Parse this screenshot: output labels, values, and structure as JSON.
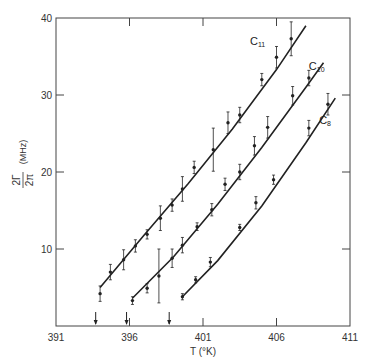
{
  "chart_data": {
    "type": "scatter",
    "title": "",
    "xlabel": "T (°K)",
    "ylabel": "2Γ / 2π (MHz)",
    "ylabel_parts": {
      "numerator": "2Γ",
      "denominator": "2π",
      "unit": "(MHz)"
    },
    "xlim": [
      391,
      411
    ],
    "ylim": [
      0,
      40
    ],
    "xticks": [
      391,
      396,
      401,
      406,
      411
    ],
    "yticks": [
      10,
      20,
      30,
      40
    ],
    "xtick_labels": [
      "391",
      "396",
      "401",
      "406",
      "411"
    ],
    "ytick_labels": [
      "10",
      "20",
      "30",
      "40"
    ],
    "grid": false,
    "legend": "none (curves labeled inline)",
    "arrows_at_T": [
      393.7,
      395.8,
      398.7
    ],
    "series": [
      {
        "name": "C11",
        "label_main": "C",
        "label_sub": "11",
        "label_pos": {
          "T": 404.2,
          "v": 36.5
        },
        "fit_line": [
          [
            394.0,
            5.0
          ],
          [
            397.0,
            11.8
          ],
          [
            400.0,
            18.5
          ],
          [
            403.0,
            25.6
          ],
          [
            406.0,
            33.3
          ],
          [
            408.0,
            39.0
          ]
        ],
        "points": [
          {
            "T": 394.0,
            "v": 4.2,
            "err": 1.0
          },
          {
            "T": 394.7,
            "v": 7.0,
            "err": 1.0
          },
          {
            "T": 395.6,
            "v": 8.6,
            "err": 1.3
          },
          {
            "T": 396.4,
            "v": 10.4,
            "err": 0.8
          },
          {
            "T": 397.2,
            "v": 11.9,
            "err": 0.6
          },
          {
            "T": 398.1,
            "v": 14.0,
            "err": 1.6
          },
          {
            "T": 398.9,
            "v": 15.7,
            "err": 0.8
          },
          {
            "T": 399.6,
            "v": 17.8,
            "err": 1.6
          },
          {
            "T": 400.4,
            "v": 20.6,
            "err": 0.8
          },
          {
            "T": 401.7,
            "v": 22.9,
            "err": 2.8
          },
          {
            "T": 402.7,
            "v": 26.4,
            "err": 1.4
          },
          {
            "T": 403.5,
            "v": 27.4,
            "err": 1.0
          },
          {
            "T": 405.0,
            "v": 32.0,
            "err": 0.8
          },
          {
            "T": 406.0,
            "v": 34.9,
            "err": 1.4
          },
          {
            "T": 407.0,
            "v": 37.3,
            "err": 2.2
          }
        ]
      },
      {
        "name": "C10",
        "label_main": "C",
        "label_sub": "10",
        "label_pos": {
          "T": 408.2,
          "v": 33.3
        },
        "fit_line": [
          [
            396.2,
            3.6
          ],
          [
            399.0,
            9.0
          ],
          [
            402.0,
            15.8
          ],
          [
            405.0,
            23.2
          ],
          [
            408.0,
            31.0
          ],
          [
            409.2,
            34.2
          ]
        ],
        "points": [
          {
            "T": 396.2,
            "v": 3.3,
            "err": 0.5
          },
          {
            "T": 397.2,
            "v": 4.9,
            "err": 0.6
          },
          {
            "T": 398.0,
            "v": 6.5,
            "err": 3.5
          },
          {
            "T": 398.9,
            "v": 8.8,
            "err": 1.2
          },
          {
            "T": 399.6,
            "v": 10.5,
            "err": 1.0
          },
          {
            "T": 400.6,
            "v": 12.9,
            "err": 0.5
          },
          {
            "T": 401.6,
            "v": 15.1,
            "err": 0.8
          },
          {
            "T": 402.5,
            "v": 18.4,
            "err": 0.8
          },
          {
            "T": 403.5,
            "v": 20.0,
            "err": 1.0
          },
          {
            "T": 404.5,
            "v": 23.4,
            "err": 1.2
          },
          {
            "T": 405.4,
            "v": 25.8,
            "err": 1.4
          },
          {
            "T": 407.1,
            "v": 29.9,
            "err": 1.2
          },
          {
            "T": 408.2,
            "v": 32.2,
            "err": 1.0
          }
        ]
      },
      {
        "name": "C8",
        "label_main": "C",
        "label_sub": "8",
        "label_pos": {
          "T": 408.9,
          "v": 26.2
        },
        "fit_line": [
          [
            399.6,
            3.8
          ],
          [
            402.0,
            8.5
          ],
          [
            405.0,
            15.6
          ],
          [
            408.0,
            23.8
          ],
          [
            410.0,
            29.6
          ]
        ],
        "points": [
          {
            "T": 399.6,
            "v": 3.8,
            "err": 0.4
          },
          {
            "T": 400.5,
            "v": 6.0,
            "err": 0.4
          },
          {
            "T": 401.5,
            "v": 8.3,
            "err": 0.6
          },
          {
            "T": 403.5,
            "v": 12.8,
            "err": 0.4
          },
          {
            "T": 404.6,
            "v": 16.0,
            "err": 0.8
          },
          {
            "T": 405.8,
            "v": 19.0,
            "err": 0.6
          },
          {
            "T": 408.2,
            "v": 25.7,
            "err": 1.0
          },
          {
            "T": 409.5,
            "v": 28.8,
            "err": 1.4
          }
        ]
      }
    ]
  },
  "colors": {
    "ink": "#222222",
    "axis": "#444444",
    "background": "#ffffff"
  }
}
